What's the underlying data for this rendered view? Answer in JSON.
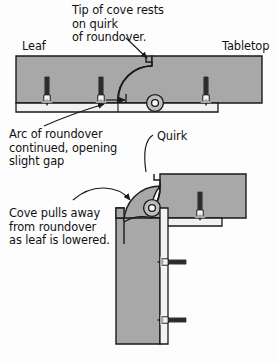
{
  "figure": {
    "background_color": "#fdfdfd",
    "wood_fill_color": "#a8a8a8",
    "metal_fill_color": "#f2f2f2",
    "outline_color": "#1a1a1a",
    "text_color": "#111111"
  },
  "labels": {
    "tip_of_cove": "Tip of cove rests\non quirk\nof roundover.",
    "leaf": "Leaf",
    "tabletop": "Tabletop",
    "arc_of_roundover": "Arc of roundover\ncontinued, opening\nslight gap",
    "quirk": "Quirk",
    "cove_pulls_away": "Cove pulls away\nfrom roundover\nas leaf is lowered."
  },
  "diagrams": [
    {
      "name": "upper-diagram",
      "description": "Leaf raised level with tabletop; cove tip rests on quirk of roundover",
      "parts": [
        "leaf-slab",
        "tabletop-slab",
        "roundover-arc",
        "cove-profile",
        "hinge-barrel",
        "hinge-plate",
        "screw-1",
        "screw-2",
        "screw-3"
      ],
      "screw_count": 3
    },
    {
      "name": "lower-diagram",
      "description": "Leaf lowered vertically; cove pulls away from roundover leaving a gap",
      "parts": [
        "tabletop-slab",
        "roundover-corner",
        "quirk-step",
        "leaf-slab-vertical",
        "hinge-barrel",
        "hinge-plate-horizontal",
        "hinge-plate-vertical",
        "screw-top",
        "screw-mid",
        "screw-low"
      ],
      "screw_count": 3
    }
  ],
  "annotations": [
    {
      "name": "tip-of-cove-leader",
      "style": "straight-arrow",
      "points_to": "cove-tip-on-quirk"
    },
    {
      "name": "arc-of-roundover-leader",
      "style": "curved-arrow",
      "points_to": "roundover-arc-upper"
    },
    {
      "name": "quirk-leader",
      "style": "curved-hook",
      "points_to": "quirk-step-lower"
    },
    {
      "name": "cove-pulls-away-leader",
      "style": "curved-arrow",
      "points_to": "gap-between-cove-and-roundover"
    }
  ]
}
